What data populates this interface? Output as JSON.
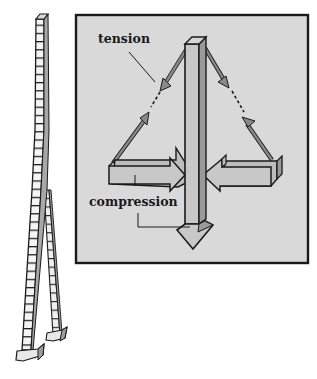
{
  "figure": {
    "labels": {
      "tension": "tension",
      "compression": "compression"
    },
    "colors": {
      "background": "#ffffff",
      "panel_fill": "#d9d9d9",
      "member_fill": "#c4c4c4",
      "member_shadow": "#9a9a9a",
      "tension_arrow": "#8a8a8a",
      "ink": "#1a1a1a"
    }
  }
}
